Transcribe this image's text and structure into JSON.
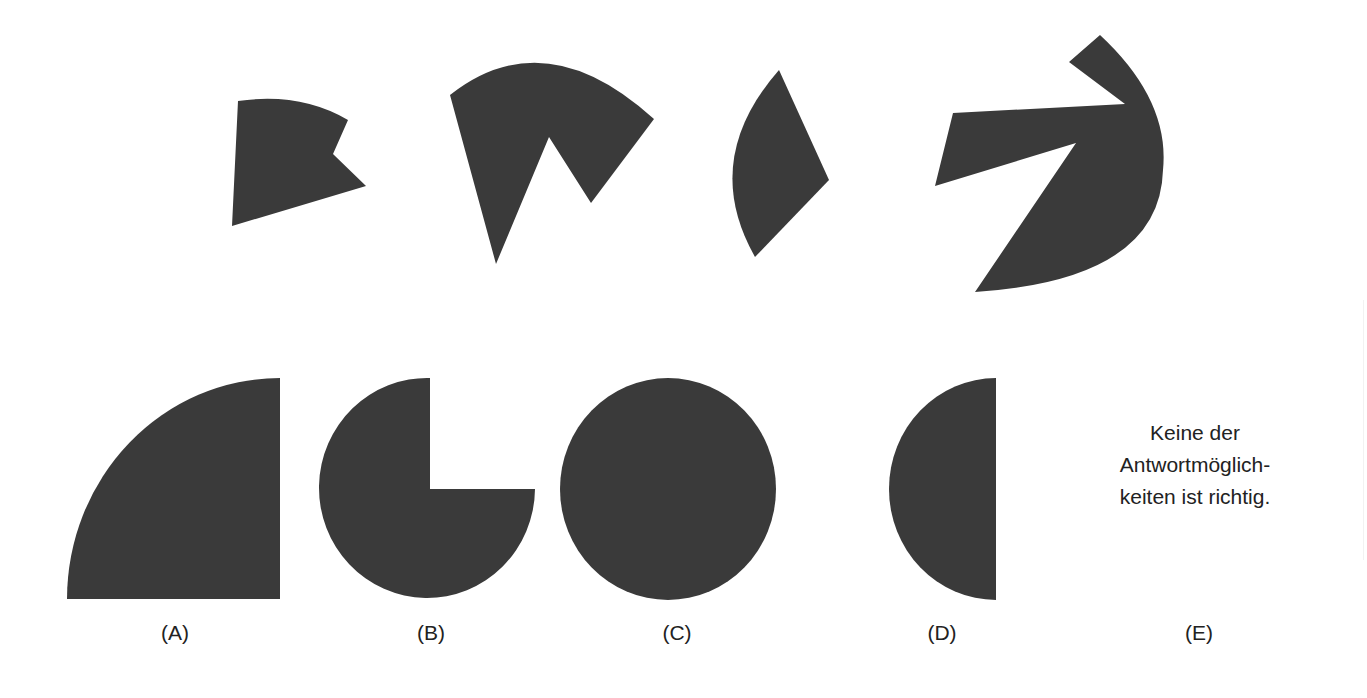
{
  "figure": {
    "fill_color": "#3a3a3a",
    "background_color": "#ffffff",
    "pieces": [
      {
        "id": "piece-1",
        "description": "sector fragment with notch"
      },
      {
        "id": "piece-2",
        "description": "sector with triangular cut-out"
      },
      {
        "id": "piece-3",
        "description": "lens-shaped sector sliver"
      },
      {
        "id": "piece-4",
        "description": "large arc segment with wedge cut-out"
      }
    ],
    "options": [
      {
        "key": "A",
        "label": "(A)",
        "shape": "quarter-circle"
      },
      {
        "key": "B",
        "label": "(B)",
        "shape": "three-quarter-circle"
      },
      {
        "key": "C",
        "label": "(C)",
        "shape": "full-circle"
      },
      {
        "key": "D",
        "label": "(D)",
        "shape": "half-circle"
      },
      {
        "key": "E",
        "label": "(E)",
        "shape": "text",
        "text_lines": [
          "Keine der",
          "Antwortmöglich-",
          "keiten ist richtig."
        ]
      }
    ]
  }
}
